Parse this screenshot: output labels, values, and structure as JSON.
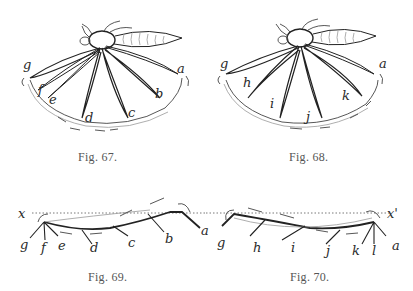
{
  "figures": [
    {
      "id": "fig67",
      "caption": "Fig. 67.",
      "labels": [
        "g",
        "f",
        "e",
        "d",
        "c",
        "b",
        "a"
      ]
    },
    {
      "id": "fig68",
      "caption": "Fig. 68.",
      "labels": [
        "g",
        "h",
        "i",
        "j",
        "k",
        "a"
      ]
    },
    {
      "id": "fig69",
      "caption": "Fig. 69.",
      "labels": [
        "x",
        "g",
        "f",
        "e",
        "d",
        "c",
        "b",
        "a"
      ]
    },
    {
      "id": "fig70",
      "caption": "Fig. 70.",
      "labels": [
        "x'",
        "g",
        "h",
        "i",
        "j",
        "k",
        "l",
        "a"
      ]
    }
  ],
  "colors": {
    "ink": "#222222",
    "caption": "#555555",
    "background": "#ffffff"
  }
}
